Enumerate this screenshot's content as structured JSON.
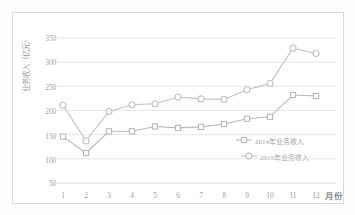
{
  "chart_data": {
    "type": "line",
    "title": "",
    "xlabel": "月份",
    "ylabel": "业务收入（亿元）",
    "categories": [
      "1",
      "2",
      "3",
      "4",
      "5",
      "6",
      "7",
      "8",
      "9",
      "10",
      "11",
      "12"
    ],
    "x": [
      1,
      2,
      3,
      4,
      5,
      6,
      7,
      8,
      9,
      10,
      11,
      12
    ],
    "ylim": [
      50,
      350
    ],
    "yticks": [
      50,
      100,
      150,
      200,
      250,
      300,
      350
    ],
    "grid": true,
    "legend_position": "inside-right",
    "series": [
      {
        "name": "2014年业务收入",
        "marker": "square",
        "color": "#b8b8b8",
        "values": [
          146,
          112,
          157,
          157,
          167,
          164,
          166,
          172,
          183,
          187,
          232,
          230
        ]
      },
      {
        "name": "2015年业务收入",
        "marker": "circle",
        "color": "#c2c2c2",
        "values": [
          211,
          137,
          198,
          212,
          214,
          228,
          224,
          223,
          243,
          256,
          329,
          318
        ]
      }
    ]
  },
  "axis": {
    "y_tick_labels": [
      "350",
      "300",
      "250",
      "200",
      "150",
      "100",
      "50"
    ],
    "x_tick_labels": [
      "1",
      "2",
      "3",
      "4",
      "5",
      "6",
      "7",
      "8",
      "9",
      "10",
      "11",
      "12"
    ],
    "y_axis_title": "业务收入（亿元）",
    "x_axis_title": "月份"
  },
  "legend": {
    "items": [
      {
        "label": "2014年业务收入",
        "marker": "square-marker"
      },
      {
        "label": "2015年业务收入",
        "marker": "circle-marker"
      }
    ]
  },
  "colors": {
    "series_2014": "#b8b8b8",
    "series_2015": "#c6c6c6",
    "grid": "#e2e2e2",
    "text": "#a0a0a0",
    "frame": "#d9d9d9"
  }
}
